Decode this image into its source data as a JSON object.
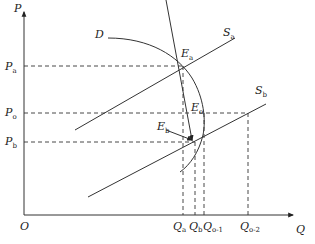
{
  "diagram": {
    "axes": {
      "y_label": "P",
      "x_label": "Q",
      "origin_label": "O"
    },
    "price_levels": [
      {
        "label": "P",
        "sub": "a"
      },
      {
        "label": "P",
        "sub": "o"
      },
      {
        "label": "P",
        "sub": "b"
      }
    ],
    "quantity_levels": [
      {
        "label": "Q",
        "sub": "a"
      },
      {
        "label": "Q",
        "sub": "b"
      },
      {
        "label": "Q",
        "sub": "o-1"
      },
      {
        "label": "Q",
        "sub": "o-2"
      }
    ],
    "curves": {
      "demand": {
        "label": "D"
      },
      "supply_a": {
        "label": "S",
        "sub": "a"
      },
      "supply_b": {
        "label": "S",
        "sub": "b"
      }
    },
    "points": {
      "ea": {
        "label": "E",
        "sub": "a"
      },
      "eo": {
        "label": "E",
        "sub": "o"
      },
      "eb": {
        "label": "E",
        "sub": "b"
      }
    }
  }
}
